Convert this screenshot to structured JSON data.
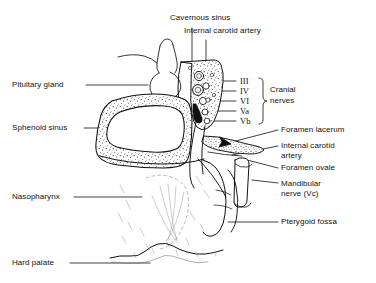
{
  "figure": {
    "type": "anatomical-line-diagram",
    "background_color": "#ffffff",
    "ink_color": "#111111"
  },
  "labels": {
    "cavernous_sinus": "Cavernous sinus",
    "internal_carotid_artery_top": "Internal carotid artery",
    "pituitary_gland": "Pituitary gland",
    "sphenoid_sinus": "Sphenoid sinus",
    "nasopharynx": "Nasopharynx",
    "hard_palate": "Hard palate",
    "foramen_lacerum": "Foramen lacerum",
    "internal_carotid_artery_line1": "Internal carotid",
    "internal_carotid_artery_line2": "artery",
    "foramen_ovale": "Foramen ovale",
    "mandibular_nerve_line1": "Mandibular",
    "mandibular_nerve_line2": "nerve (Vc)",
    "pterygoid_fossa": "Pterygoid fossa",
    "cranial_nerves_line1": "Cranial",
    "cranial_nerves_line2": "nerves"
  },
  "cranial_nerves": [
    {
      "id": "III",
      "label": "III"
    },
    {
      "id": "IV",
      "label": "IV"
    },
    {
      "id": "VI",
      "label": "VI"
    },
    {
      "id": "Va",
      "label": "Va"
    },
    {
      "id": "Vb",
      "label": "Vb"
    }
  ]
}
